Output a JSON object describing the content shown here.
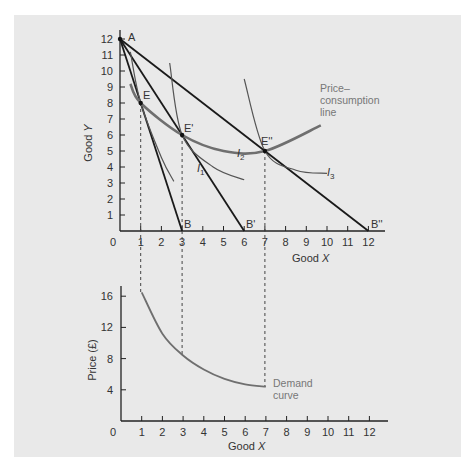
{
  "chart_data": [
    {
      "type": "line",
      "title": "",
      "xlabel": "Good X",
      "ylabel": "Good Y",
      "xlim": [
        0,
        12.5
      ],
      "ylim": [
        0,
        12.5
      ],
      "x_ticks": [
        "0",
        "1",
        "2",
        "3",
        "4",
        "5",
        "6",
        "7",
        "8",
        "9",
        "10",
        "11",
        "12"
      ],
      "y_ticks": [
        "1",
        "2",
        "3",
        "4",
        "5",
        "6",
        "7",
        "8",
        "9",
        "10",
        "11",
        "12"
      ],
      "grid": false,
      "series": [
        {
          "name": "Budget line AB",
          "points": [
            [
              0,
              12
            ],
            [
              3,
              0
            ]
          ]
        },
        {
          "name": "Budget line AB'",
          "points": [
            [
              0,
              12
            ],
            [
              6,
              0
            ]
          ]
        },
        {
          "name": "Budget line AB''",
          "points": [
            [
              0,
              12
            ],
            [
              12,
              0
            ]
          ]
        },
        {
          "name": "I1",
          "points": [
            [
              0.5,
              11.2
            ],
            [
              1,
              8
            ],
            [
              2,
              4.6
            ],
            [
              2.6,
              3.1
            ]
          ]
        },
        {
          "name": "I2",
          "points": [
            [
              2.4,
              10.5
            ],
            [
              3,
              6
            ],
            [
              4.5,
              4
            ],
            [
              6,
              3.2
            ]
          ]
        },
        {
          "name": "I3",
          "points": [
            [
              6,
              9.5
            ],
            [
              7,
              5
            ],
            [
              8.5,
              3.8
            ],
            [
              10,
              3.6
            ]
          ]
        },
        {
          "name": "Price-consumption line",
          "points": [
            [
              0.5,
              9.2
            ],
            [
              1,
              8
            ],
            [
              3,
              6
            ],
            [
              5,
              5
            ],
            [
              7,
              5
            ],
            [
              9.7,
              6.6
            ]
          ]
        }
      ],
      "points": [
        {
          "label": "A",
          "x": 0,
          "y": 12
        },
        {
          "label": "E",
          "x": 1,
          "y": 8
        },
        {
          "label": "E'",
          "x": 3,
          "y": 6
        },
        {
          "label": "E''",
          "x": 7,
          "y": 5
        },
        {
          "label": "B",
          "x": 3,
          "y": 0
        },
        {
          "label": "B'",
          "x": 6,
          "y": 0
        },
        {
          "label": "B''",
          "x": 12,
          "y": 0
        }
      ],
      "annotations": [
        "Price–consumption line",
        "I1",
        "I2",
        "I3"
      ]
    },
    {
      "type": "line",
      "title": "",
      "xlabel": "Good X",
      "ylabel": "Price (£)",
      "xlim": [
        0,
        12.5
      ],
      "ylim": [
        0,
        17
      ],
      "x_ticks": [
        "0",
        "1",
        "2",
        "3",
        "4",
        "5",
        "6",
        "7",
        "8",
        "9",
        "10",
        "11",
        "12"
      ],
      "y_ticks": [
        "4",
        "8",
        "12",
        "16"
      ],
      "grid": false,
      "series": [
        {
          "name": "Demand curve",
          "points": [
            [
              1,
              16.5
            ],
            [
              2,
              11.2
            ],
            [
              3,
              8.4
            ],
            [
              4,
              6.6
            ],
            [
              5,
              5.4
            ],
            [
              6,
              4.7
            ],
            [
              7,
              4.4
            ]
          ]
        }
      ],
      "annotations": [
        "Demand curve"
      ]
    }
  ],
  "top": {
    "y_label": "Good Y",
    "x_label": "Good",
    "x_label_italic": "X",
    "y_label_good": "Good",
    "y_label_italic": "Y",
    "pc_label": [
      "Price–",
      "consumption",
      "line"
    ],
    "i_labels": [
      {
        "text": "I",
        "sub": "1"
      },
      {
        "text": "I",
        "sub": "2"
      },
      {
        "text": "I",
        "sub": "3"
      }
    ],
    "points": {
      "A": "A",
      "E": "E",
      "E1": "E'",
      "E2": "E''",
      "B": "B",
      "B1": "B'",
      "B2": "B''"
    }
  },
  "bottom": {
    "y_label": "Price (£)",
    "x_label": "Good",
    "x_label_italic": "X",
    "demand_label": [
      "Demand",
      "curve"
    ]
  },
  "colors": {
    "panel": "#e9e9e9",
    "budget": "#1a1a1a",
    "indiff": "#555555",
    "pcl": "#6f6f6f",
    "demand": "#6f6f6f",
    "note": "#777777"
  }
}
